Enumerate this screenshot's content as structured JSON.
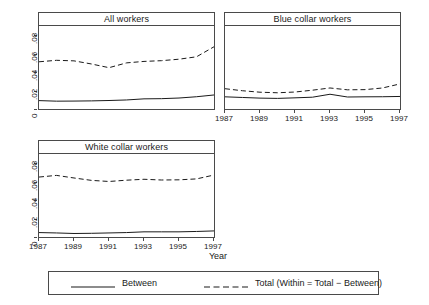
{
  "figure": {
    "xlabel": "Year",
    "legend": {
      "entries": [
        {
          "label": "Between",
          "style": "solid"
        },
        {
          "label": "Total (Within = Total − Between)",
          "style": "dashed"
        }
      ]
    }
  },
  "chart_data": {
    "type": "line",
    "title": "",
    "xlabel": "Year",
    "ylabel": "",
    "xlim": [
      1987,
      1997
    ],
    "ylim": [
      0,
      0.09
    ],
    "yticks": [
      0,
      0.02,
      0.04,
      0.06,
      0.08
    ],
    "ytick_labels": [
      "0",
      ".02",
      ".04",
      ".06",
      ".08"
    ],
    "xticks": [
      1987,
      1989,
      1991,
      1993,
      1995,
      1997
    ],
    "xtick_labels": [
      "1987",
      "1989",
      "1991",
      "1993",
      "1995",
      "1997"
    ],
    "grid": false,
    "legend_position": "bottom",
    "panels": [
      {
        "title": "All workers",
        "x": [
          1987,
          1988,
          1989,
          1990,
          1991,
          1992,
          1993,
          1994,
          1995,
          1996,
          1997
        ],
        "series": [
          {
            "name": "Between",
            "style": "solid",
            "values": [
              0.0091,
              0.0085,
              0.0086,
              0.0088,
              0.0092,
              0.0098,
              0.011,
              0.0112,
              0.0119,
              0.0133,
              0.0152
            ]
          },
          {
            "name": "Total (Within = Total − Between)",
            "style": "dashed",
            "values": [
              0.0512,
              0.0528,
              0.0522,
              0.0488,
              0.0448,
              0.05,
              0.0516,
              0.0524,
              0.054,
              0.0566,
              0.0675
            ]
          }
        ]
      },
      {
        "title": "Blue collar workers",
        "x": [
          1987,
          1988,
          1989,
          1990,
          1991,
          1992,
          1993,
          1994,
          1995,
          1996,
          1997
        ],
        "series": [
          {
            "name": "Between",
            "style": "solid",
            "values": [
              0.0132,
              0.0125,
              0.0118,
              0.0115,
              0.0121,
              0.0128,
              0.016,
              0.013,
              0.0132,
              0.0133,
              0.0136
            ]
          },
          {
            "name": "Total (Within = Total − Between)",
            "style": "dashed",
            "values": [
              0.022,
              0.0198,
              0.0182,
              0.0176,
              0.0184,
              0.0204,
              0.0228,
              0.0208,
              0.021,
              0.0228,
              0.0272
            ]
          }
        ]
      },
      {
        "title": "White collar workers",
        "x": [
          1987,
          1988,
          1989,
          1990,
          1991,
          1992,
          1993,
          1994,
          1995,
          1996,
          1997
        ],
        "series": [
          {
            "name": "Between",
            "style": "solid",
            "values": [
              0.0048,
              0.0044,
              0.0038,
              0.004,
              0.0044,
              0.0048,
              0.0056,
              0.0056,
              0.0056,
              0.006,
              0.0066
            ]
          },
          {
            "name": "Total (Within = Total − Between)",
            "style": "dashed",
            "values": [
              0.065,
              0.0668,
              0.064,
              0.0614,
              0.0602,
              0.0616,
              0.0626,
              0.0618,
              0.062,
              0.063,
              0.0672
            ]
          }
        ]
      }
    ]
  }
}
